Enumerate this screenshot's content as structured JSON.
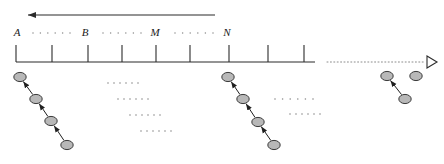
{
  "figure": {
    "type": "timeline-diagram",
    "background_color": "#ffffff",
    "line_color": "#2b2b2b",
    "node_fill_color": "#b8b8b8",
    "node_stroke_color": "#3a3a3a",
    "dot_color": "#8c8c8c"
  },
  "top_arrow": {
    "name": "leftward-direction-arrow",
    "x_start": 215,
    "x_end": 28,
    "y": 15,
    "direction": "left",
    "style": "solid"
  },
  "axis": {
    "name": "main-timeline-axis",
    "y": 62,
    "solid_start_x": 16,
    "solid_end_x": 315,
    "dotted_start_x": 327,
    "dotted_end_x": 425,
    "arrowhead_x": 437,
    "arrowhead_style": "open-triangle",
    "tick_height": 17,
    "tick_positions": [
      16,
      52,
      88,
      122,
      156,
      190,
      229,
      268,
      304
    ]
  },
  "interval_labels": [
    {
      "text": "A",
      "x": 17,
      "y": 36
    },
    {
      "text": "B",
      "x": 85,
      "y": 36
    },
    {
      "text": "M",
      "x": 155,
      "y": 36
    },
    {
      "text": "N",
      "x": 227,
      "y": 36
    }
  ],
  "label_ellipses": [
    {
      "name": "ellipsis-a-b",
      "x_start": 33,
      "x_end": 70,
      "y": 33,
      "count": 6
    },
    {
      "name": "ellipsis-b-m",
      "x_start": 103,
      "x_end": 141,
      "y": 33,
      "count": 6
    },
    {
      "name": "ellipsis-m-n",
      "x_start": 175,
      "x_end": 213,
      "y": 33,
      "count": 6
    }
  ],
  "node_chains": [
    {
      "name": "chain-left",
      "nodes": [
        {
          "cx": 20,
          "cy": 77
        },
        {
          "cx": 36,
          "cy": 99
        },
        {
          "cx": 51,
          "cy": 121
        },
        {
          "cx": 67,
          "cy": 145
        }
      ],
      "arrow_direction": "up-left",
      "arrow_count": 3
    },
    {
      "name": "chain-middle",
      "nodes": [
        {
          "cx": 228,
          "cy": 77
        },
        {
          "cx": 243,
          "cy": 99
        },
        {
          "cx": 258,
          "cy": 122
        },
        {
          "cx": 274,
          "cy": 145
        }
      ],
      "arrow_direction": "up-left",
      "arrow_count": 3
    },
    {
      "name": "chain-right",
      "nodes": [
        {
          "cx": 387,
          "cy": 76
        },
        {
          "cx": 405,
          "cy": 99
        }
      ],
      "arrow_direction": "up-left",
      "arrow_count": 1
    }
  ],
  "standalone_nodes": [
    {
      "name": "node-isolated-right",
      "cx": 416,
      "cy": 76
    }
  ],
  "dot_rows_middle": [
    {
      "name": "dot-row-1",
      "x_start": 108,
      "x_end": 138,
      "y": 83,
      "count": 6
    },
    {
      "name": "dot-row-2",
      "x_start": 118,
      "x_end": 148,
      "y": 99,
      "count": 6
    },
    {
      "name": "dot-row-3",
      "x_start": 130,
      "x_end": 160,
      "y": 115,
      "count": 6
    },
    {
      "name": "dot-row-4",
      "x_start": 141,
      "x_end": 171,
      "y": 131,
      "count": 6
    }
  ],
  "dot_rows_right": [
    {
      "name": "dot-row-5",
      "x_start": 275,
      "x_end": 313,
      "y": 99,
      "count": 6
    },
    {
      "name": "dot-row-6",
      "x_start": 290,
      "x_end": 320,
      "y": 114,
      "count": 6
    }
  ]
}
